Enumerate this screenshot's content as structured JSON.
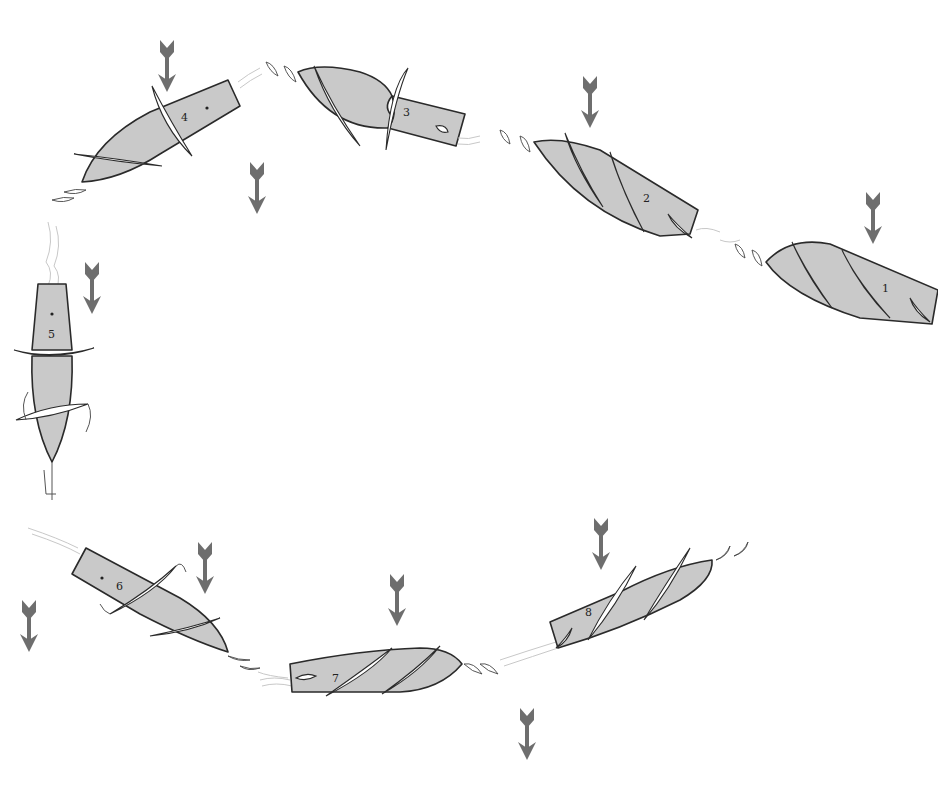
{
  "diagram": {
    "type": "sequence-loop-illustration",
    "colors": {
      "body_fill": "#c9c9c9",
      "outline": "#2a2a2a",
      "arrow": "#6e6e6e",
      "blade": "#ffffff",
      "wake": "#c8c8c8"
    },
    "stages": [
      {
        "id": 1,
        "label": "1"
      },
      {
        "id": 2,
        "label": "2"
      },
      {
        "id": 3,
        "label": "3"
      },
      {
        "id": 4,
        "label": "4"
      },
      {
        "id": 5,
        "label": "5"
      },
      {
        "id": 6,
        "label": "6"
      },
      {
        "id": 7,
        "label": "7"
      },
      {
        "id": 8,
        "label": "8"
      }
    ],
    "arrows": {
      "direction": "down",
      "count": 11
    }
  }
}
